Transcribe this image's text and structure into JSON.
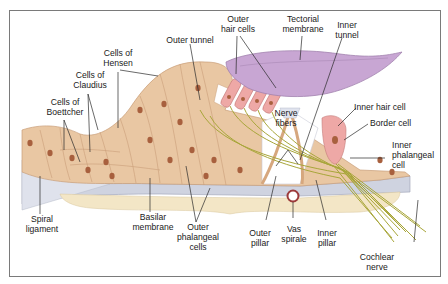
{
  "diagram": {
    "colors": {
      "cell_tan": "#e9c7a3",
      "cell_tan_dark": "#d6a77e",
      "nucleus": "#a8603e",
      "hair_cell_pink": "#eea8a6",
      "tectorial_purple": "#c8a6d3",
      "nerve_olive": "#a8a63a",
      "basilar_grey": "#cfd3e0",
      "frame_grey": "#7a7a7a",
      "leader_line": "#2a2a2a"
    },
    "labels": {
      "outer_hair_cells": "Outer\nhair cells",
      "tectorial_membrane": "Tectorial\nmembrane",
      "inner_tunnel": "Inner\ntunnel",
      "outer_tunnel": "Outer tunnel",
      "cells_of_hensen": "Cells of\nHensen",
      "cells_of_claudius": "Cells of\nClaudius",
      "cells_of_boettcher": "Cells of\nBoettcher",
      "nerve_fibers": "Nerve\nfibers",
      "inner_hair_cell": "Inner hair cell",
      "border_cell": "Border cell",
      "inner_phalangeal_cell": "Inner\nphalangeal\ncell",
      "spiral_ligament": "Spiral\nligament",
      "basilar_membrane": "Basilar\nmembrane",
      "outer_phalangeal_cells": "Outer\nphalangeal\ncells",
      "outer_pillar": "Outer\npillar",
      "vas_spirale": "Vas\nspirale",
      "inner_pillar": "Inner\npillar",
      "cochlear_nerve": "Cochlear\nnerve"
    }
  }
}
